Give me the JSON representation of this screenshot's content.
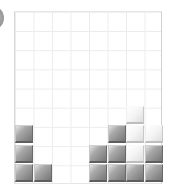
{
  "game": {
    "name": "falling-block-puzzle",
    "board": {
      "columns": 8,
      "rows": 9,
      "cell_size_px": 18.5,
      "grid_color": "#ececec"
    },
    "block_colors": {
      "gray": "#8d8d8d",
      "light": "#f4f4f4"
    },
    "blocks": [
      {
        "col": 0,
        "row_from_bottom": 1,
        "color": "gray"
      },
      {
        "col": 1,
        "row_from_bottom": 1,
        "color": "gray"
      },
      {
        "col": 4,
        "row_from_bottom": 1,
        "color": "gray"
      },
      {
        "col": 5,
        "row_from_bottom": 1,
        "color": "gray"
      },
      {
        "col": 6,
        "row_from_bottom": 1,
        "color": "gray"
      },
      {
        "col": 7,
        "row_from_bottom": 1,
        "color": "gray"
      },
      {
        "col": 0,
        "row_from_bottom": 2,
        "color": "gray"
      },
      {
        "col": 4,
        "row_from_bottom": 2,
        "color": "gray"
      },
      {
        "col": 5,
        "row_from_bottom": 2,
        "color": "gray"
      },
      {
        "col": 6,
        "row_from_bottom": 2,
        "color": "light"
      },
      {
        "col": 7,
        "row_from_bottom": 2,
        "color": "gray"
      },
      {
        "col": 0,
        "row_from_bottom": 3,
        "color": "gray"
      },
      {
        "col": 5,
        "row_from_bottom": 3,
        "color": "gray"
      },
      {
        "col": 6,
        "row_from_bottom": 3,
        "color": "light"
      },
      {
        "col": 7,
        "row_from_bottom": 3,
        "color": "light"
      },
      {
        "col": 6,
        "row_from_bottom": 4,
        "color": "light"
      }
    ]
  }
}
